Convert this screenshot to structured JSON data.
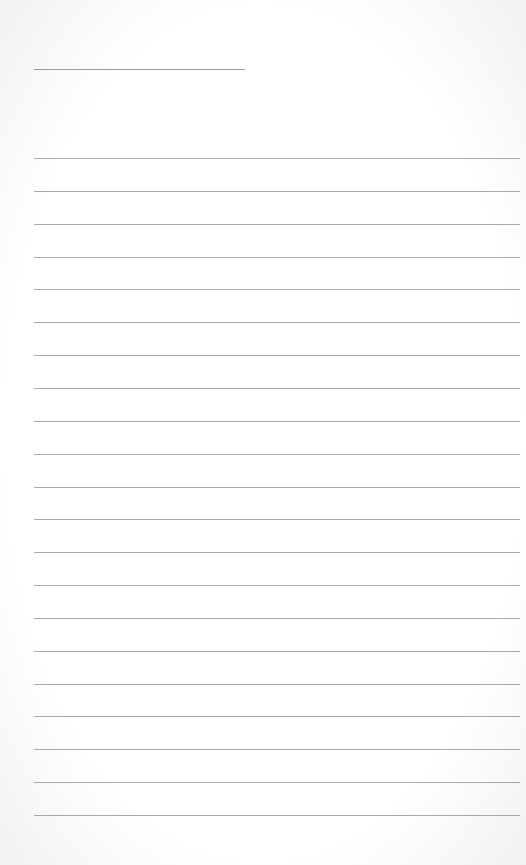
{
  "document": {
    "type": "lined-paper",
    "title_line": {
      "present": true
    },
    "rule_count": 21,
    "rule_spacing_px": 32.85,
    "colors": {
      "paper": "#ffffff",
      "rule": "#a8a8a8"
    }
  }
}
